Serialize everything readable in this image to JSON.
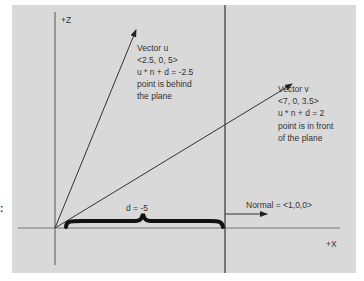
{
  "axes": {
    "z_label": "+Z",
    "x_label": "+X"
  },
  "vector_u": {
    "title": "Vector u",
    "components": "<2.5, 0, 5>",
    "equation": "u * n + d = -2.5",
    "result_line1": "point is behind",
    "result_line2": "the plane"
  },
  "vector_v": {
    "title": "Vector v",
    "components": "<7, 0, 3.5>",
    "equation": "u * n + d = 2",
    "result_line1": "point is in front",
    "result_line2": "of the plane"
  },
  "distance_label": "d = -5",
  "normal_label": "Normal = <1,0,0>",
  "side_mark": ":",
  "colors": {
    "background": "#d9d9d9",
    "line": "#333333",
    "brace": "#111111"
  }
}
